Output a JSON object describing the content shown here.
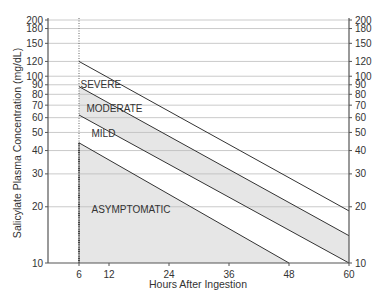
{
  "chart_data": {
    "type": "line",
    "title": "",
    "xlabel": "Hours After Ingestion",
    "ylabel": "Salicylate Plasma Concentration (mg/dL)",
    "yscale": "log",
    "xlim": [
      0,
      60
    ],
    "ylim": [
      10,
      200
    ],
    "x_ticks": [
      6,
      12,
      24,
      36,
      48,
      60
    ],
    "y_ticks": [
      10,
      20,
      30,
      40,
      50,
      60,
      70,
      80,
      90,
      100,
      120,
      150,
      180,
      200
    ],
    "grid": true,
    "reference_line": {
      "x": 6,
      "style": "dotted"
    },
    "series": [
      {
        "name": "SEVERE",
        "points": [
          [
            6,
            120
          ],
          [
            60,
            19
          ]
        ]
      },
      {
        "name": "MODERATE",
        "points": [
          [
            6,
            88
          ],
          [
            60,
            14
          ]
        ]
      },
      {
        "name": "MILD",
        "points": [
          [
            6,
            62
          ],
          [
            60,
            10
          ]
        ]
      },
      {
        "name": "ASYMPTOMATIC",
        "points": [
          [
            6,
            44
          ],
          [
            48,
            10
          ]
        ]
      }
    ],
    "shaded_regions": [
      {
        "name": "MODERATE",
        "between": [
          "MODERATE",
          "MILD"
        ]
      },
      {
        "name": "ASYMPTOMATIC",
        "below": "ASYMPTOMATIC"
      }
    ],
    "zone_labels": [
      {
        "text": "SEVERE",
        "x": 6.3,
        "y": 86
      },
      {
        "text": "MODERATE",
        "x": 7.5,
        "y": 64
      },
      {
        "text": "MILD",
        "x": 8.5,
        "y": 47
      },
      {
        "text": "ASYMPTOMATIC",
        "x": 8.5,
        "y": 18.5
      }
    ]
  },
  "colors": {
    "shade": "#e6e6e6",
    "line": "#333333",
    "grid": "#bdbdbd",
    "axis": "#555555"
  }
}
